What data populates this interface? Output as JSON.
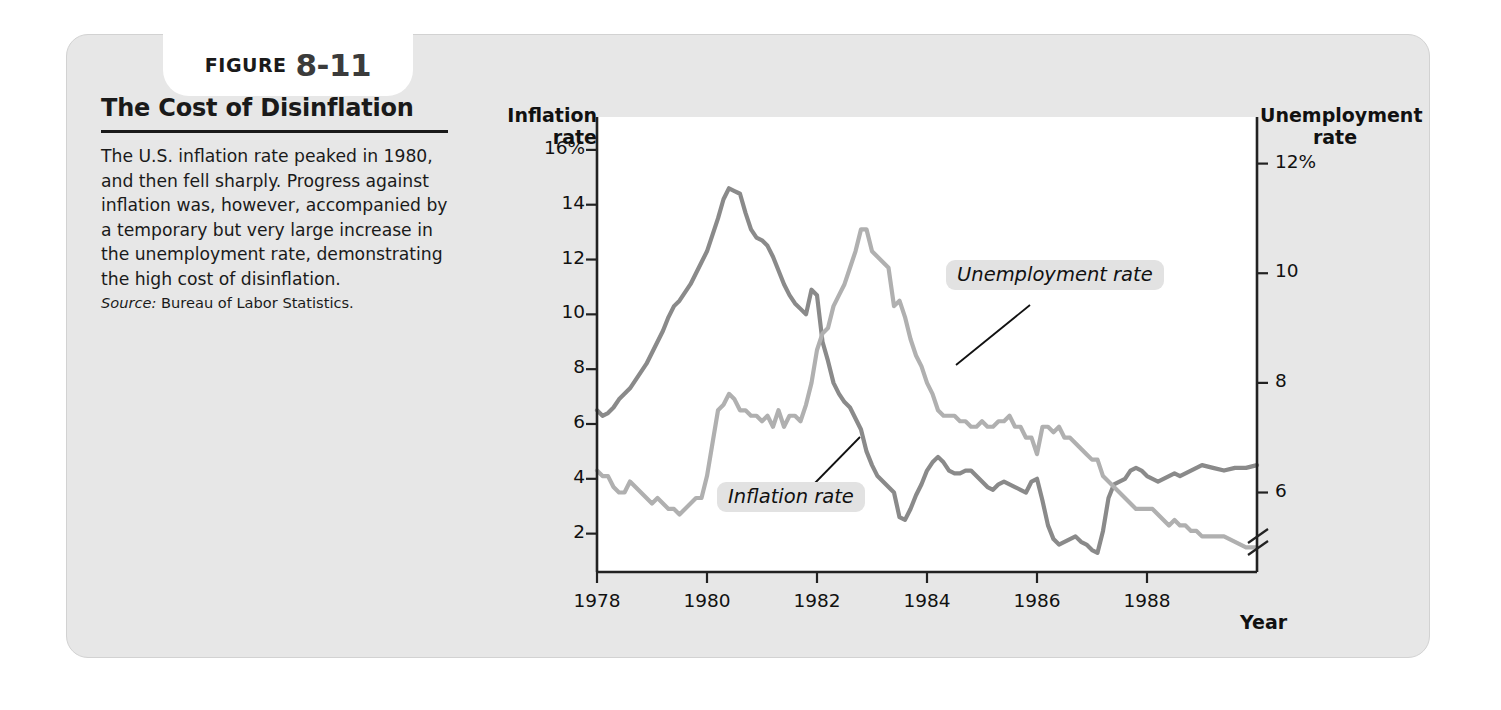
{
  "figure": {
    "label_word": "FIGURE",
    "number": "8-11",
    "title": "The Cost of Disinflation",
    "body": "The U.S. inflation rate peaked in 1980, and then fell sharply. Progress against inflation was, however, accompanied by a temporary but very large increase in the unemployment rate, demonstrating the high cost of disinflation.",
    "source_label": "Source:",
    "source_text": "Bureau of Labor Statistics."
  },
  "colors": {
    "card_background": "#e7e7e7",
    "plot_background": "#ffffff",
    "inflation_line": "#8a8a8a",
    "unemployment_line": "#b0b0b0",
    "axis": "#222222",
    "tag_background": "#e2e2e2"
  },
  "chart_data": {
    "type": "line",
    "title": "The Cost of Disinflation",
    "xlabel": "Year",
    "grid": false,
    "legend_position": "inline-annotation",
    "x_ticks": [
      "1978",
      "1980",
      "1982",
      "1984",
      "1986",
      "1988"
    ],
    "x_tick_values": [
      1978,
      1980,
      1982,
      1984,
      1986,
      1988
    ],
    "xlim": [
      1978,
      1990
    ],
    "left_axis": {
      "label": "Inflation rate",
      "ticks": [
        "16%",
        "14",
        "12",
        "10",
        "8",
        "6",
        "4",
        "2"
      ],
      "tick_values": [
        16,
        14,
        12,
        10,
        8,
        6,
        4,
        2
      ],
      "ylim": [
        0.6,
        17.2
      ],
      "unit": "%"
    },
    "right_axis": {
      "label": "Unemployment rate",
      "ticks": [
        "12%",
        "10",
        "8",
        "6"
      ],
      "tick_values": [
        12,
        10,
        8,
        6
      ],
      "ylim": [
        4.55,
        12.85
      ],
      "unit": "%",
      "axis_break": true
    },
    "series": [
      {
        "name": "Inflation rate",
        "axis": "left",
        "color": "#8a8a8a",
        "x": [
          1978.0,
          1978.1,
          1978.2,
          1978.3,
          1978.4,
          1978.5,
          1978.6,
          1978.7,
          1978.8,
          1978.9,
          1979.0,
          1979.1,
          1979.2,
          1979.3,
          1979.4,
          1979.5,
          1979.6,
          1979.7,
          1979.8,
          1979.9,
          1980.0,
          1980.1,
          1980.2,
          1980.3,
          1980.4,
          1980.5,
          1980.6,
          1980.7,
          1980.8,
          1980.9,
          1981.0,
          1981.1,
          1981.2,
          1981.3,
          1981.4,
          1981.5,
          1981.6,
          1981.7,
          1981.8,
          1981.9,
          1982.0,
          1982.1,
          1982.2,
          1982.3,
          1982.4,
          1982.5,
          1982.6,
          1982.7,
          1982.8,
          1982.9,
          1983.0,
          1983.1,
          1983.2,
          1983.3,
          1983.4,
          1983.5,
          1983.6,
          1983.7,
          1983.8,
          1983.9,
          1984.0,
          1984.1,
          1984.2,
          1984.3,
          1984.4,
          1984.5,
          1984.6,
          1984.7,
          1984.8,
          1984.9,
          1985.0,
          1985.1,
          1985.2,
          1985.3,
          1985.4,
          1985.5,
          1985.6,
          1985.7,
          1985.8,
          1985.9,
          1986.0,
          1986.1,
          1986.2,
          1986.3,
          1986.4,
          1986.5,
          1986.6,
          1986.7,
          1986.8,
          1986.9,
          1987.0,
          1987.1,
          1987.2,
          1987.3,
          1987.4,
          1987.5,
          1987.6,
          1987.7,
          1987.8,
          1987.9,
          1988.0,
          1988.1,
          1988.2,
          1988.3,
          1988.4,
          1988.5,
          1988.6,
          1988.7,
          1988.8,
          1988.9,
          1989.0,
          1989.2,
          1989.4,
          1989.6,
          1989.8,
          1990.0
        ],
        "y": [
          6.5,
          6.3,
          6.4,
          6.6,
          6.9,
          7.1,
          7.3,
          7.6,
          7.9,
          8.2,
          8.6,
          9.0,
          9.4,
          9.9,
          10.3,
          10.5,
          10.8,
          11.1,
          11.5,
          11.9,
          12.3,
          12.9,
          13.5,
          14.2,
          14.6,
          14.5,
          14.4,
          13.7,
          13.1,
          12.8,
          12.7,
          12.5,
          12.1,
          11.6,
          11.1,
          10.7,
          10.4,
          10.2,
          10.0,
          10.9,
          10.7,
          9.0,
          8.3,
          7.5,
          7.1,
          6.8,
          6.6,
          6.2,
          5.8,
          5.0,
          4.5,
          4.1,
          3.9,
          3.7,
          3.5,
          2.6,
          2.5,
          2.9,
          3.4,
          3.8,
          4.3,
          4.6,
          4.8,
          4.6,
          4.3,
          4.2,
          4.2,
          4.3,
          4.3,
          4.1,
          3.9,
          3.7,
          3.6,
          3.8,
          3.9,
          3.8,
          3.7,
          3.6,
          3.5,
          3.9,
          4.0,
          3.2,
          2.3,
          1.8,
          1.6,
          1.7,
          1.8,
          1.9,
          1.7,
          1.6,
          1.4,
          1.3,
          2.1,
          3.3,
          3.8,
          3.9,
          4.0,
          4.3,
          4.4,
          4.3,
          4.1,
          4.0,
          3.9,
          4.0,
          4.1,
          4.2,
          4.1,
          4.2,
          4.3,
          4.4,
          4.5,
          4.4,
          4.3,
          4.4,
          4.4,
          4.5
        ],
        "peak": {
          "year": 1980.4,
          "value": 14.6
        },
        "trough": {
          "year": 1987.0,
          "value": 1.4
        }
      },
      {
        "name": "Unemployment rate",
        "axis": "right",
        "color": "#b0b0b0",
        "x": [
          1978.0,
          1978.1,
          1978.2,
          1978.3,
          1978.4,
          1978.5,
          1978.6,
          1978.7,
          1978.8,
          1978.9,
          1979.0,
          1979.1,
          1979.2,
          1979.3,
          1979.4,
          1979.5,
          1979.6,
          1979.7,
          1979.8,
          1979.9,
          1980.0,
          1980.1,
          1980.2,
          1980.3,
          1980.4,
          1980.5,
          1980.6,
          1980.7,
          1980.8,
          1980.9,
          1981.0,
          1981.1,
          1981.2,
          1981.3,
          1981.4,
          1981.5,
          1981.6,
          1981.7,
          1981.8,
          1981.9,
          1982.0,
          1982.1,
          1982.2,
          1982.3,
          1982.4,
          1982.5,
          1982.6,
          1982.7,
          1982.8,
          1982.9,
          1983.0,
          1983.1,
          1983.2,
          1983.3,
          1983.4,
          1983.5,
          1983.6,
          1983.7,
          1983.8,
          1983.9,
          1984.0,
          1984.1,
          1984.2,
          1984.3,
          1984.4,
          1984.5,
          1984.6,
          1984.7,
          1984.8,
          1984.9,
          1985.0,
          1985.1,
          1985.2,
          1985.3,
          1985.4,
          1985.5,
          1985.6,
          1985.7,
          1985.8,
          1985.9,
          1986.0,
          1986.1,
          1986.2,
          1986.3,
          1986.4,
          1986.5,
          1986.6,
          1986.7,
          1986.8,
          1986.9,
          1987.0,
          1987.1,
          1987.2,
          1987.3,
          1987.4,
          1987.5,
          1987.6,
          1987.7,
          1987.8,
          1987.9,
          1988.0,
          1988.1,
          1988.2,
          1988.3,
          1988.4,
          1988.5,
          1988.6,
          1988.7,
          1988.8,
          1988.9,
          1989.0,
          1989.2,
          1989.4,
          1989.6,
          1989.8,
          1990.0
        ],
        "y": [
          6.4,
          6.3,
          6.3,
          6.1,
          6.0,
          6.0,
          6.2,
          6.1,
          6.0,
          5.9,
          5.8,
          5.9,
          5.8,
          5.7,
          5.7,
          5.6,
          5.7,
          5.8,
          5.9,
          5.9,
          6.3,
          6.9,
          7.5,
          7.6,
          7.8,
          7.7,
          7.5,
          7.5,
          7.4,
          7.4,
          7.3,
          7.4,
          7.2,
          7.5,
          7.2,
          7.4,
          7.4,
          7.3,
          7.6,
          8.0,
          8.6,
          8.9,
          9.0,
          9.4,
          9.6,
          9.8,
          10.1,
          10.4,
          10.8,
          10.8,
          10.4,
          10.3,
          10.2,
          10.1,
          9.4,
          9.5,
          9.2,
          8.8,
          8.5,
          8.3,
          8.0,
          7.8,
          7.5,
          7.4,
          7.4,
          7.4,
          7.3,
          7.3,
          7.2,
          7.2,
          7.3,
          7.2,
          7.2,
          7.3,
          7.3,
          7.4,
          7.2,
          7.2,
          7.0,
          7.0,
          6.7,
          7.2,
          7.2,
          7.1,
          7.2,
          7.0,
          7.0,
          6.9,
          6.8,
          6.7,
          6.6,
          6.6,
          6.3,
          6.2,
          6.1,
          6.0,
          5.9,
          5.8,
          5.7,
          5.7,
          5.7,
          5.7,
          5.6,
          5.5,
          5.4,
          5.5,
          5.4,
          5.4,
          5.3,
          5.3,
          5.2,
          5.2,
          5.2,
          5.1,
          5.0,
          5.0
        ],
        "peak": {
          "year": 1982.9,
          "value": 10.8
        },
        "trough": {
          "year": 1979.5,
          "value": 5.6
        }
      }
    ]
  }
}
